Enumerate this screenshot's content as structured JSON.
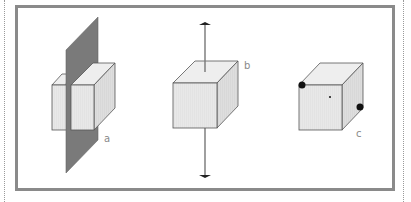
{
  "figure": {
    "panels": [
      {
        "id": "a",
        "label": "a",
        "description": "cube bisected by a plane of symmetry"
      },
      {
        "id": "b",
        "label": "b",
        "description": "cube with an axis of rotation passing through it"
      },
      {
        "id": "c",
        "label": "c",
        "description": "cube with center of inversion and opposite corner points"
      }
    ]
  },
  "colors": {
    "frame": "#8a8a8a",
    "plane": "#7a7a7a",
    "cube_face": "#e6e6e6",
    "cube_top": "#eeeeee",
    "cube_side": "#dcdcdc",
    "edge": "#555555",
    "axis": "#777777",
    "dot": "#111111"
  }
}
